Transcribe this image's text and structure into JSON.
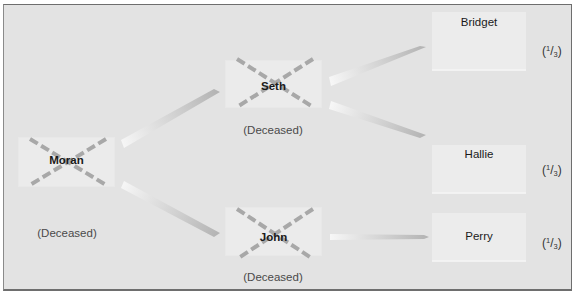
{
  "diagram": {
    "type": "inheritance-tree",
    "deceased_label": "(Deceased)",
    "nodes": {
      "moran": {
        "name": "Moran",
        "status": "(Deceased)",
        "crossed_out": true
      },
      "seth": {
        "name": "Seth",
        "status": "(Deceased)",
        "crossed_out": true
      },
      "john": {
        "name": "John",
        "status": "(Deceased)",
        "crossed_out": true
      },
      "bridget": {
        "name": "Bridget",
        "share_num": "1",
        "share_den": "3",
        "share_open": "(",
        "share_close": ")"
      },
      "hallie": {
        "name": "Hallie",
        "share_num": "1",
        "share_den": "3",
        "share_open": "(",
        "share_close": ")"
      },
      "perry": {
        "name": "Perry",
        "share_num": "1",
        "share_den": "3",
        "share_open": "(",
        "share_close": ")"
      }
    },
    "edges": [
      {
        "from": "Moran",
        "to": "Seth"
      },
      {
        "from": "Moran",
        "to": "John"
      },
      {
        "from": "Seth",
        "to": "Bridget"
      },
      {
        "from": "Seth",
        "to": "Hallie"
      },
      {
        "from": "John",
        "to": "Perry"
      }
    ],
    "colors": {
      "background": "#e3e3e3",
      "box": "#ebebeb",
      "cross": "#a8a8a8",
      "arrow_dark": "#b4b4b4",
      "arrow_light": "#f6f6f6",
      "border": "#6e6e6e"
    }
  }
}
